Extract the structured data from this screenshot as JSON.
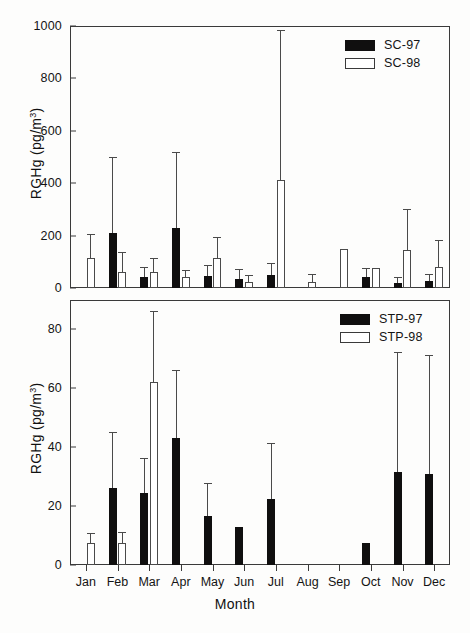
{
  "figure": {
    "xlabel": "Month",
    "months": [
      "Jan",
      "Feb",
      "Mar",
      "Apr",
      "May",
      "Jun",
      "Jul",
      "Aug",
      "Sep",
      "Oct",
      "Nov",
      "Dec"
    ]
  },
  "chart_data": [
    {
      "type": "bar",
      "panel": "top",
      "title": "",
      "xlabel": "",
      "ylabel": "RGHg (pg/m3)",
      "ylabel_display": "RGHg (pg/m",
      "ylabel_sup": "3",
      "ylabel_tail": ")",
      "categories": [
        "Jan",
        "Feb",
        "Mar",
        "Apr",
        "May",
        "Jun",
        "Jul",
        "Aug",
        "Sep",
        "Oct",
        "Nov",
        "Dec"
      ],
      "ylim": [
        0,
        1000
      ],
      "yticks": [
        0,
        200,
        400,
        600,
        800,
        1000
      ],
      "grid": false,
      "legend_position": "top-right",
      "series": [
        {
          "name": "SC-97",
          "style": "filled",
          "color": "#100f0f",
          "values": [
            null,
            209,
            42,
            229,
            45,
            34,
            50,
            null,
            null,
            42,
            18,
            27
          ],
          "err_high": [
            null,
            495,
            78,
            515,
            85,
            68,
            92,
            null,
            null,
            74,
            38,
            48
          ]
        },
        {
          "name": "SC-98",
          "style": "open",
          "color": "#ffffff",
          "values": [
            113,
            62,
            63,
            43,
            114,
            22,
            412,
            23,
            148,
            76,
            146,
            82
          ],
          "err_high": [
            202,
            135,
            112,
            66,
            192,
            45,
            980,
            48,
            148,
            76,
            297,
            181
          ]
        }
      ]
    },
    {
      "type": "bar",
      "panel": "bottom",
      "title": "",
      "xlabel": "Month",
      "ylabel": "RGHg (pg/m3)",
      "ylabel_display": "RGHg (pg/m",
      "ylabel_sup": "3",
      "ylabel_tail": ")",
      "categories": [
        "Jan",
        "Feb",
        "Mar",
        "Apr",
        "May",
        "Jun",
        "Jul",
        "Aug",
        "Sep",
        "Oct",
        "Nov",
        "Dec"
      ],
      "ylim": [
        0,
        90
      ],
      "yticks": [
        0,
        20,
        40,
        60,
        80
      ],
      "grid": false,
      "legend_position": "top-right",
      "series": [
        {
          "name": "STP-97",
          "style": "filled",
          "color": "#100f0f",
          "values": [
            null,
            26,
            24.5,
            43,
            16.5,
            13,
            22.5,
            null,
            null,
            7.5,
            31.5,
            31
          ],
          "err_high": [
            null,
            45,
            36,
            66,
            27.5,
            13,
            41,
            null,
            null,
            7.5,
            72,
            71
          ]
        },
        {
          "name": "STP-98",
          "style": "open",
          "color": "#ffffff",
          "values": [
            7.5,
            7.5,
            62,
            null,
            null,
            null,
            null,
            null,
            null,
            null,
            null,
            null
          ],
          "err_high": [
            10.5,
            11,
            86,
            null,
            null,
            null,
            null,
            null,
            null,
            null,
            null,
            null
          ]
        }
      ]
    }
  ],
  "legends": {
    "top": [
      {
        "label": "SC-97",
        "style": "filled"
      },
      {
        "label": "SC-98",
        "style": "open"
      }
    ],
    "bottom": [
      {
        "label": "STP-97",
        "style": "filled"
      },
      {
        "label": "STP-98",
        "style": "open"
      }
    ]
  }
}
